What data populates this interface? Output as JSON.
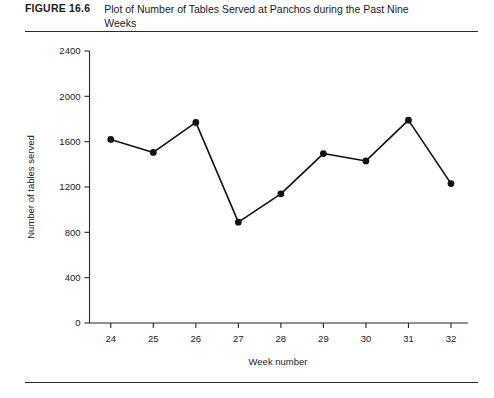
{
  "figure": {
    "number": "FIGURE 16.6",
    "caption": "Plot of Number of Tables Served at Panchos during the Past Nine Weeks"
  },
  "chart_data": {
    "type": "line",
    "title": "Plot of Number of Tables Served at Panchos during the Past Nine Weeks",
    "xlabel": "Week number",
    "ylabel": "Number of tables served",
    "categories": [
      24,
      25,
      26,
      27,
      28,
      29,
      30,
      31,
      32
    ],
    "x_tick_labels": [
      "24",
      "25",
      "26",
      "27",
      "28",
      "29",
      "30",
      "31",
      "32"
    ],
    "values": [
      1620,
      1505,
      1770,
      890,
      1140,
      1495,
      1430,
      1790,
      1230
    ],
    "y_ticks": [
      0,
      400,
      800,
      1200,
      1600,
      2000,
      2400
    ],
    "y_tick_labels": [
      "0",
      "400",
      "800",
      "1200",
      "1600",
      "2000",
      "2400"
    ],
    "ylim": [
      0,
      2400
    ],
    "xlim": [
      23.5,
      32.4
    ],
    "grid": false,
    "legend": null,
    "marker": "filled-circle",
    "line_color": "#111111",
    "marker_color": "#111111"
  }
}
